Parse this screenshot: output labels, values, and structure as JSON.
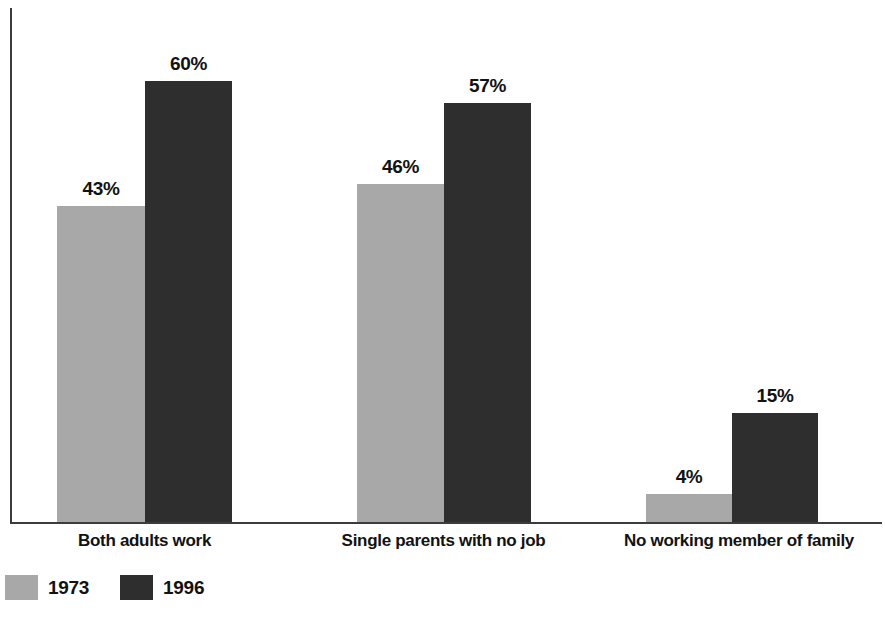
{
  "chart_data": {
    "type": "bar",
    "title": "",
    "subtitle": "",
    "xlabel": "",
    "ylabel": "",
    "categories": [
      "Both adults work",
      "Single parents with no job",
      "No working member of family"
    ],
    "series": [
      {
        "name": "1973",
        "color": "#a8a8a8",
        "values": [
          43,
          46,
          4
        ],
        "value_labels": [
          "43%",
          "46%",
          "4%"
        ]
      },
      {
        "name": "1996",
        "color": "#2e2e2e",
        "values": [
          60,
          57,
          15
        ],
        "value_labels": [
          "60%",
          "57%",
          "15%"
        ]
      }
    ],
    "ylim": [
      0,
      71
    ],
    "grid": false,
    "legend_position": "bottom-left",
    "value_label_suffix": "%",
    "axis_color": "#3c3c3c"
  },
  "legend": {
    "entries": [
      {
        "label": "1973",
        "color": "#a8a8a8"
      },
      {
        "label": "1996",
        "color": "#2e2e2e"
      }
    ]
  }
}
